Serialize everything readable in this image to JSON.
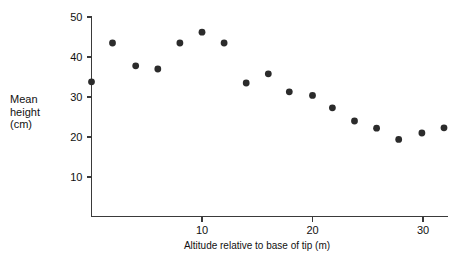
{
  "chart_data": {
    "type": "scatter",
    "title": "",
    "xlabel": "Altitude relative to base of tip (m)",
    "ylabel": "Mean height (cm)",
    "ylabel_lines": [
      "Mean",
      "height",
      "(cm)"
    ],
    "xlim": [
      0,
      32.5
    ],
    "ylim": [
      0,
      50
    ],
    "xticks": [
      10,
      20,
      30
    ],
    "xtick_labels": [
      "10",
      "20",
      "30"
    ],
    "yticks": [
      10,
      20,
      30,
      40,
      50
    ],
    "ytick_labels": [
      "10",
      "20",
      "30",
      "40",
      "50"
    ],
    "grid": false,
    "legend": false,
    "marker": "filled-circle",
    "marker_color": "#2b2b2b",
    "axis_color": "#3a3a3a",
    "points": [
      {
        "x": 0.0,
        "y": 33.8
      },
      {
        "x": 1.9,
        "y": 43.5
      },
      {
        "x": 4.0,
        "y": 37.8
      },
      {
        "x": 6.0,
        "y": 37.0
      },
      {
        "x": 8.0,
        "y": 43.5
      },
      {
        "x": 10.0,
        "y": 46.2
      },
      {
        "x": 12.0,
        "y": 43.5
      },
      {
        "x": 14.0,
        "y": 33.5
      },
      {
        "x": 16.0,
        "y": 35.8
      },
      {
        "x": 17.9,
        "y": 31.3
      },
      {
        "x": 20.0,
        "y": 30.4
      },
      {
        "x": 21.8,
        "y": 27.3
      },
      {
        "x": 23.8,
        "y": 24.0
      },
      {
        "x": 25.8,
        "y": 22.2
      },
      {
        "x": 27.8,
        "y": 19.4
      },
      {
        "x": 29.9,
        "y": 21.0
      },
      {
        "x": 31.9,
        "y": 22.3
      }
    ]
  },
  "axes": {
    "x_axis_name": "x-axis",
    "y_axis_name": "y-axis"
  }
}
